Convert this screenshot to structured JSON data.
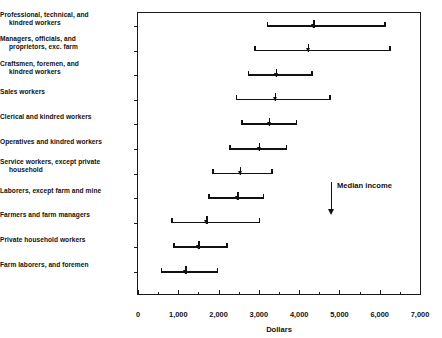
{
  "chart_data": {
    "type": "bar",
    "title": "",
    "subtitle": "",
    "xlabel": "Dollars",
    "ylabel": "",
    "xlim": [
      0,
      7000
    ],
    "grid": false,
    "legend_position": "none",
    "orientation": "horizontal",
    "bar_style": "range-with-median-marker",
    "xticks": [
      0,
      1000,
      2000,
      3000,
      4000,
      5000,
      6000,
      7000
    ],
    "xtick_labels": [
      "0",
      "1,000",
      "2,000",
      "3,000",
      "4,000",
      "5,000",
      "6,000",
      "7,000"
    ],
    "xticks_minor": [
      500,
      1500,
      2500,
      3500,
      4500,
      5500,
      6500
    ],
    "annotations": [
      {
        "text": "Median income",
        "marker": "down-arrow"
      }
    ],
    "categories": [
      "Professional, technical, and kindred workers",
      "Managers, officials, and proprietors, exc. farm",
      "Craftsmen, foremen, and kindred workers",
      "Sales workers",
      "Clerical and kindred workers",
      "Operatives and kindred workers",
      "Service workers, except private household",
      "Laborers, except farm and mine",
      "Farmers and farm managers",
      "Private household workers",
      "Farm laborers, and foremen"
    ],
    "series": [
      {
        "name": "Range low",
        "values": [
          3200,
          2880,
          2730,
          2430,
          2560,
          2260,
          1840,
          1740,
          820,
          870,
          570
        ]
      },
      {
        "name": "Median income",
        "values": [
          4350,
          4220,
          3420,
          3400,
          3250,
          3000,
          2530,
          2460,
          1690,
          1490,
          1170
        ]
      },
      {
        "name": "Range high",
        "values": [
          6150,
          6280,
          4340,
          4790,
          3950,
          3700,
          3350,
          3130,
          3030,
          2230,
          1990
        ]
      }
    ],
    "rows": [
      {
        "label_line1": "Professional, technical, and",
        "label_line2": "kindred workers",
        "low": 3200,
        "median": 4350,
        "high": 6150
      },
      {
        "label_line1": "Managers, officials, and",
        "label_line2": "proprietors, exc. farm",
        "low": 2880,
        "median": 4220,
        "high": 6280
      },
      {
        "label_line1": "Craftsmen, foremen, and",
        "label_line2": "kindred workers",
        "low": 2730,
        "median": 3420,
        "high": 4340
      },
      {
        "label_line1": "Sales workers",
        "label_line2": "",
        "low": 2430,
        "median": 3400,
        "high": 4790
      },
      {
        "label_line1": "Clerical and kindred workers",
        "label_line2": "",
        "low": 2560,
        "median": 3250,
        "high": 3950
      },
      {
        "label_line1": "Operatives and kindred workers",
        "label_line2": "",
        "low": 2260,
        "median": 3000,
        "high": 3700
      },
      {
        "label_line1": "Service workers, except private",
        "label_line2": "household",
        "low": 1840,
        "median": 2530,
        "high": 3350
      },
      {
        "label_line1": "Laborers, except farm and mine",
        "label_line2": "",
        "low": 1740,
        "median": 2460,
        "high": 3130
      },
      {
        "label_line1": "Farmers and farm managers",
        "label_line2": "",
        "low": 820,
        "median": 1690,
        "high": 3030
      },
      {
        "label_line1": "Private household workers",
        "label_line2": "",
        "low": 870,
        "median": 1490,
        "high": 2230
      },
      {
        "label_line1": "Farm laborers, and foremen",
        "label_line2": "",
        "low": 570,
        "median": 1170,
        "high": 1990
      }
    ],
    "colors": {
      "bar": "#111111",
      "axis": "#1b1b1b",
      "background": "#ffffff",
      "text": "#111111"
    }
  }
}
